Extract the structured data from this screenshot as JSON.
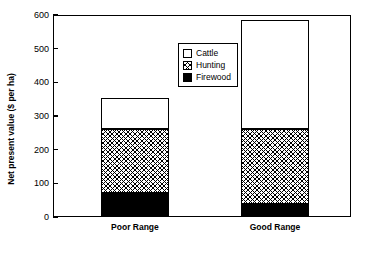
{
  "chart_data": {
    "type": "bar",
    "title": "",
    "xlabel": "",
    "ylabel": "Net present value ($ per ha)",
    "categories": [
      "Poor Range",
      "Good Range"
    ],
    "series": [
      {
        "name": "Firewood",
        "values": [
          70,
          40
        ]
      },
      {
        "name": "Hunting",
        "values": [
          192,
          220
        ]
      },
      {
        "name": "Cattle",
        "values": [
          92,
          325
        ]
      }
    ],
    "totals": [
      354,
      585
    ],
    "stacked": true,
    "ylim": [
      0,
      600
    ],
    "yticks": [
      0,
      100,
      200,
      300,
      400,
      500,
      600
    ],
    "ytick_labels": [
      "0",
      "100",
      "200",
      "300",
      "400",
      "500",
      "600"
    ],
    "grid": false,
    "legend_position": "inside-top-center",
    "legend_entries": [
      "Cattle",
      "Hunting",
      "Firewood"
    ],
    "colors": {
      "Cattle": "#ffffff",
      "Hunting": "#ffffff",
      "Firewood": "#000000",
      "axis": "#000000",
      "background": "#ffffff"
    }
  }
}
